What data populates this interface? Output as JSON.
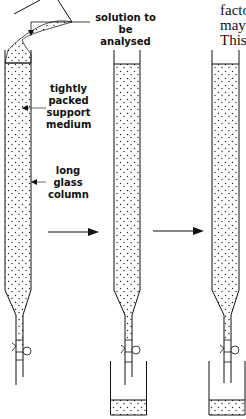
{
  "diagram": {
    "labels": {
      "solution": "solution to be\nanalysed",
      "solution_line1": "solution to be",
      "solution_line2": "analysed",
      "medium_line1": "tightly",
      "medium_line2": "packed",
      "medium_line3": "support",
      "medium_line4": "medium",
      "column_line1": "long",
      "column_line2": "glass",
      "column_line3": "column"
    },
    "stages": [
      {
        "name": "stage-1",
        "description": "solution poured onto column"
      },
      {
        "name": "stage-2",
        "description": "eluate collected in beaker"
      },
      {
        "name": "stage-3",
        "description": "further eluate collected in beaker"
      }
    ],
    "arrows": 2
  },
  "side_text": {
    "line1": "facto",
    "line2": "may",
    "line3": "This"
  },
  "colors": {
    "ink": "#111111",
    "background": "#ffffff"
  }
}
